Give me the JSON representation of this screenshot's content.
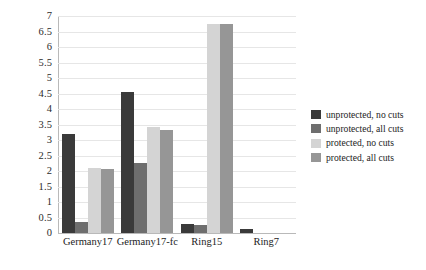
{
  "chart_data": {
    "type": "bar",
    "title": "",
    "subtitle": "",
    "xlabel": "",
    "ylabel": "",
    "ylim": [
      0,
      7
    ],
    "ytick_step": 0.5,
    "grid": true,
    "grid_axis": "y",
    "legend_position": "right",
    "categories": [
      "Germany17",
      "Germany17-fc",
      "Ring15",
      "Ring7"
    ],
    "yticks": [
      "0",
      "0.5",
      "1",
      "1.5",
      "2",
      "2.5",
      "3",
      "3.5",
      "4",
      "4.5",
      "5",
      "5.5",
      "6",
      "6.5",
      "7"
    ],
    "series": [
      {
        "name": "unprotected, no cuts",
        "color": "#3a3a3a",
        "values": [
          3.2,
          4.55,
          0.3,
          0.12
        ]
      },
      {
        "name": "unprotected, all cuts",
        "color": "#6e6e6e",
        "values": [
          0.35,
          2.25,
          0.25,
          0
        ]
      },
      {
        "name": "protected, no cuts",
        "color": "#d4d4d4",
        "values": [
          2.1,
          3.42,
          6.75,
          0
        ]
      },
      {
        "name": "protected, all cuts",
        "color": "#969696",
        "values": [
          2.05,
          3.32,
          6.75,
          0
        ]
      }
    ]
  },
  "axes": {
    "y_axis_name": "y-axis",
    "x_axis_name": "x-axis"
  },
  "colors": {
    "background": "#ffffff",
    "gridline": "#e6e6e6",
    "axis_line": "#b9b9b9",
    "text": "#1d1d1d"
  }
}
